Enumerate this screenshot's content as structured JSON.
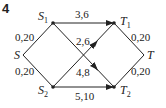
{
  "problem_number": "4",
  "nodes": {
    "S": {
      "label": "S",
      "sub": ""
    },
    "S1": {
      "label": "S",
      "sub": "1"
    },
    "S2": {
      "label": "S",
      "sub": "2"
    },
    "T1": {
      "label": "T",
      "sub": "1"
    },
    "T2": {
      "label": "T",
      "sub": "2"
    },
    "T": {
      "label": "T",
      "sub": ""
    }
  },
  "edges": [
    {
      "from": "S",
      "to": "S1",
      "label": "0,20"
    },
    {
      "from": "S",
      "to": "S2",
      "label": "0,20"
    },
    {
      "from": "S1",
      "to": "T1",
      "label": "3,6"
    },
    {
      "from": "S2",
      "to": "T1",
      "label": "2,6"
    },
    {
      "from": "S1",
      "to": "T2",
      "label": "4,8"
    },
    {
      "from": "S2",
      "to": "T2",
      "label": "5,10"
    },
    {
      "from": "T1",
      "to": "T",
      "label": "0,20"
    },
    {
      "from": "T2",
      "to": "T",
      "label": "0,20"
    }
  ]
}
